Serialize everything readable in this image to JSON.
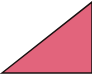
{
  "shape": {
    "type": "right-triangle",
    "fill": "#e2647c",
    "stroke": "#1a1010",
    "background": "#ffffff",
    "points": "2,73 92,2 92,73"
  }
}
